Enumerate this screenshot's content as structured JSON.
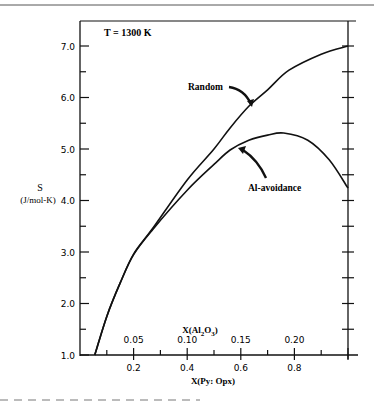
{
  "chart_data": {
    "type": "line",
    "title": "",
    "annotation_temperature": "T = 1300 K",
    "ylabel": "S",
    "ylabel_units": "(J/mol-K)",
    "xlabel": "X(Py: Opx)",
    "x2label": "X(Al2O3)",
    "x2label_parts": {
      "pre": "X(Al",
      "sub1": "2",
      "mid": "O",
      "sub2": "3",
      "post": ")"
    },
    "xlim": [
      0,
      1.0
    ],
    "ylim": [
      1.0,
      7.5
    ],
    "yticks": [
      1.0,
      2.0,
      3.0,
      4.0,
      5.0,
      6.0,
      7.0
    ],
    "ytick_labels": [
      "1.0",
      "2.0",
      "3.0",
      "4.0",
      "5.0",
      "6.0",
      "7.0"
    ],
    "xticks": [
      0.2,
      0.4,
      0.6,
      0.8
    ],
    "xtick_labels": [
      "0.2",
      "0.4",
      "0.6",
      "0.8"
    ],
    "x2ticks_at_x": [
      0.2,
      0.4,
      0.6,
      0.8
    ],
    "x2tick_labels": [
      "0.05",
      "0.10",
      "0.15",
      "0.20"
    ],
    "grid": false,
    "legend": "inline labels with arrows",
    "series": [
      {
        "name": "Random",
        "x": [
          0.055,
          0.1,
          0.15,
          0.2,
          0.27,
          0.4,
          0.5,
          0.56,
          0.63,
          0.7,
          0.78,
          0.9,
          1.0
        ],
        "values": [
          1.0,
          1.75,
          2.4,
          2.96,
          3.45,
          4.4,
          5.0,
          5.41,
          5.83,
          6.15,
          6.53,
          6.84,
          7.0
        ]
      },
      {
        "name": "Al-avoidance",
        "x": [
          0.055,
          0.1,
          0.15,
          0.2,
          0.27,
          0.4,
          0.5,
          0.56,
          0.63,
          0.7,
          0.76,
          0.85,
          0.93,
          1.0
        ],
        "values": [
          1.0,
          1.75,
          2.4,
          2.95,
          3.43,
          4.2,
          4.7,
          4.98,
          5.17,
          5.27,
          5.31,
          5.17,
          4.79,
          4.24
        ]
      }
    ],
    "annotations": [
      {
        "text": "Random",
        "points_to": "Random"
      },
      {
        "text": "Al-avoidance",
        "points_to": "Al-avoidance"
      }
    ]
  },
  "labels": {
    "temperature": "T = 1300 K",
    "random": "Random",
    "al_avoidance": "Al-avoidance",
    "y_symbol": "S",
    "y_units": "(J/mol-K)",
    "x_bottom": "X(Py: Opx)"
  }
}
